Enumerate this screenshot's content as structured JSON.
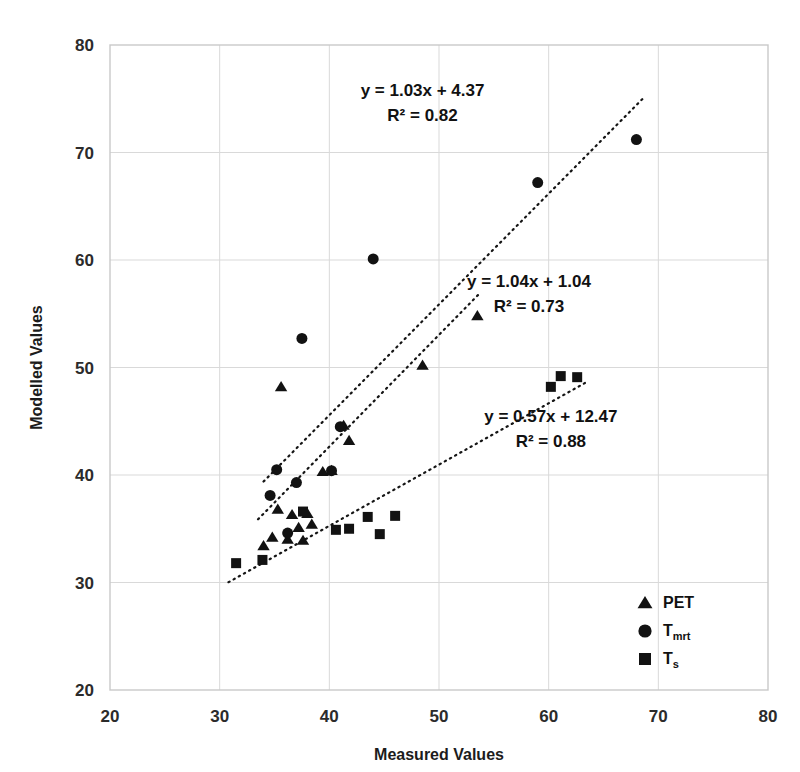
{
  "chart_data": {
    "type": "scatter",
    "title": "",
    "xlabel": "Measured Values",
    "ylabel": "Modelled Values",
    "xlim": [
      20,
      80
    ],
    "ylim": [
      20,
      80
    ],
    "xticks": [
      20,
      30,
      40,
      50,
      60,
      70,
      80
    ],
    "yticks": [
      20,
      30,
      40,
      50,
      60,
      70,
      80
    ],
    "grid": true,
    "legend_position": "bottom-right",
    "series": [
      {
        "name": "PET",
        "marker": "triangle",
        "color": "#121212",
        "points": [
          [
            34.0,
            33.4
          ],
          [
            34.8,
            34.2
          ],
          [
            35.3,
            36.8
          ],
          [
            35.6,
            48.2
          ],
          [
            36.2,
            34.0
          ],
          [
            36.6,
            36.3
          ],
          [
            37.2,
            35.1
          ],
          [
            37.6,
            33.9
          ],
          [
            38.0,
            36.4
          ],
          [
            38.4,
            35.4
          ],
          [
            39.4,
            40.3
          ],
          [
            40.2,
            40.4
          ],
          [
            41.3,
            44.6
          ],
          [
            41.8,
            43.2
          ],
          [
            48.5,
            50.2
          ],
          [
            53.5,
            54.8
          ]
        ],
        "trendline": {
          "equation": "y = 1.04x + 1.04",
          "r2_label": "R² = 0.73",
          "slope": 1.04,
          "intercept": 1.04,
          "r2": 0.73,
          "x_start": 33.5,
          "x_end": 53.8
        }
      },
      {
        "name": "Tmrt",
        "label_base": "T",
        "label_sub": "mrt",
        "marker": "circle",
        "color": "#121212",
        "points": [
          [
            34.6,
            38.1
          ],
          [
            35.2,
            40.5
          ],
          [
            36.2,
            34.6
          ],
          [
            37.0,
            39.3
          ],
          [
            37.5,
            52.7
          ],
          [
            40.2,
            40.4
          ],
          [
            41.0,
            44.5
          ],
          [
            44.0,
            60.1
          ],
          [
            59.0,
            67.2
          ],
          [
            68.0,
            71.2
          ]
        ],
        "trendline": {
          "equation": "y = 1.03x + 4.37",
          "r2_label": "R² = 0.82",
          "slope": 1.03,
          "intercept": 4.37,
          "r2": 0.82,
          "x_start": 34.0,
          "x_end": 68.8
        }
      },
      {
        "name": "Ts",
        "label_base": "T",
        "label_sub": "s",
        "marker": "square",
        "color": "#121212",
        "points": [
          [
            31.5,
            31.8
          ],
          [
            33.9,
            32.1
          ],
          [
            37.6,
            36.6
          ],
          [
            40.6,
            34.9
          ],
          [
            41.8,
            35.0
          ],
          [
            43.5,
            36.1
          ],
          [
            44.6,
            34.5
          ],
          [
            46.0,
            36.2
          ],
          [
            60.2,
            48.2
          ],
          [
            61.1,
            49.2
          ],
          [
            62.6,
            49.1
          ]
        ],
        "trendline": {
          "equation": "y = 0.57x + 12.47",
          "r2_label": "R² = 0.88",
          "slope": 0.57,
          "intercept": 12.47,
          "r2": 0.88,
          "x_start": 30.8,
          "x_end": 63.4
        }
      }
    ],
    "annotations": [
      {
        "id": "ann-tmrt",
        "line1": "y = 1.03x + 4.37",
        "line2": "R² = 0.82",
        "x": 48.5,
        "y": 75.3
      },
      {
        "id": "ann-pet",
        "line1": "y = 1.04x + 1.04",
        "line2": "R² = 0.73",
        "x": 58.2,
        "y": 57.5
      },
      {
        "id": "ann-ts",
        "line1": "y = 0.57x + 12.47",
        "line2": "R² = 0.88",
        "x": 60.2,
        "y": 44.9
      }
    ]
  }
}
